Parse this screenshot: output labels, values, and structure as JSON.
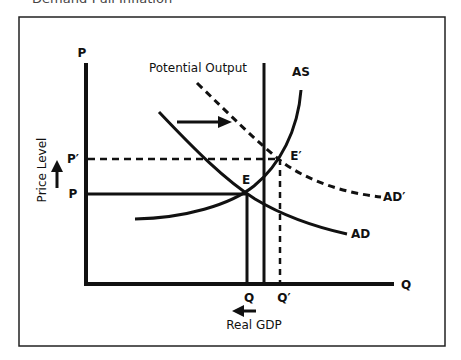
{
  "title": "Demand-Pull Inflation",
  "diagram": {
    "y_axis_label": "P",
    "x_axis_label": "Q",
    "y_axis_title": "Price Level",
    "x_axis_title": "Real GDP",
    "potential_output_label": "Potential Output",
    "as_label": "AS",
    "ad_label": "AD",
    "ad_prime_label": "AD′",
    "e_label": "E",
    "e_prime_label": "E′",
    "p_label": "P",
    "p_prime_label": "P′",
    "q_label": "Q",
    "q_prime_label": "Q′"
  },
  "colors": {
    "line": "#111111",
    "frame": "#222222",
    "title": "#444444"
  }
}
